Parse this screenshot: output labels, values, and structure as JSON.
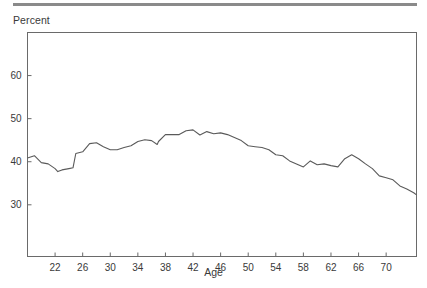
{
  "chart_data": {
    "type": "line",
    "title": "",
    "xlabel": "Age",
    "ylabel": "Percent",
    "xlim": [
      18,
      74.4
    ],
    "ylim": [
      18,
      70
    ],
    "grid": false,
    "legend": null,
    "x_ticks": [
      22,
      26,
      30,
      34,
      38,
      42,
      46,
      50,
      54,
      58,
      62,
      66,
      70
    ],
    "y_ticks": [
      30,
      40,
      50,
      60
    ],
    "series": [
      {
        "name": "Percent",
        "color": "#5a5a5a",
        "x": [
          18,
          19,
          20,
          21,
          22,
          22.4,
          23,
          24,
          24.6,
          25,
          26,
          27,
          28,
          29,
          30,
          31,
          32,
          33,
          34,
          35,
          36,
          36.8,
          37,
          38,
          39,
          40,
          41,
          42,
          43,
          44,
          45,
          46,
          47,
          48,
          49,
          50,
          51,
          52,
          53,
          54,
          55,
          56,
          57,
          58,
          59,
          60,
          61,
          62,
          63,
          64,
          65,
          66,
          67,
          68,
          69,
          70,
          71,
          72,
          73,
          74,
          74.4
        ],
        "values": [
          40.9,
          41.4,
          39.8,
          39.5,
          38.4,
          37.7,
          38.1,
          38.4,
          38.6,
          41.9,
          42.3,
          44.2,
          44.4,
          43.5,
          42.8,
          42.8,
          43.3,
          43.7,
          44.7,
          45.1,
          44.9,
          44.0,
          44.7,
          46.3,
          46.3,
          46.3,
          47.2,
          47.4,
          46.2,
          47.0,
          46.5,
          46.7,
          46.3,
          45.6,
          44.9,
          43.7,
          43.5,
          43.3,
          42.8,
          41.6,
          41.4,
          40.2,
          39.5,
          38.8,
          40.2,
          39.3,
          39.5,
          39.1,
          38.8,
          40.7,
          41.6,
          40.7,
          39.5,
          38.4,
          36.7,
          36.3,
          35.8,
          34.4,
          33.7,
          32.8,
          32.3
        ]
      }
    ]
  },
  "labels": {
    "y_title": "Percent",
    "x_title": "Age"
  }
}
